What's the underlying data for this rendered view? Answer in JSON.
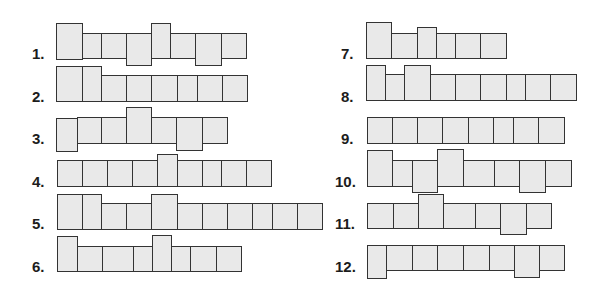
{
  "colors": {
    "fill": "#e9e9e9",
    "stroke": "#333333",
    "label": "#1c1c1c"
  },
  "rows": [
    {
      "label": "1.",
      "lx": 32,
      "ly": 46,
      "cells": [
        [
          56,
          82,
          23,
          59
        ],
        [
          82,
          101,
          33,
          58
        ],
        [
          101,
          126,
          33,
          58
        ],
        [
          126,
          151,
          33,
          65
        ],
        [
          151,
          170,
          23,
          58
        ],
        [
          170,
          195,
          33,
          58
        ],
        [
          195,
          221,
          33,
          65
        ],
        [
          221,
          246,
          33,
          58
        ]
      ]
    },
    {
      "label": "2.",
      "lx": 32,
      "ly": 89,
      "cells": [
        [
          56,
          82,
          66,
          101
        ],
        [
          82,
          101,
          66,
          101
        ],
        [
          101,
          126,
          75,
          101
        ],
        [
          126,
          151,
          75,
          101
        ],
        [
          151,
          177,
          75,
          101
        ],
        [
          177,
          197,
          75,
          101
        ],
        [
          197,
          222,
          75,
          101
        ],
        [
          222,
          247,
          75,
          101
        ]
      ]
    },
    {
      "label": "3.",
      "lx": 32,
      "ly": 131,
      "cells": [
        [
          56,
          77,
          118,
          151
        ],
        [
          77,
          101,
          117,
          143
        ],
        [
          101,
          126,
          117,
          143
        ],
        [
          126,
          151,
          107,
          143
        ],
        [
          151,
          176,
          117,
          143
        ],
        [
          176,
          202,
          117,
          150
        ],
        [
          202,
          227,
          117,
          143
        ]
      ]
    },
    {
      "label": "4.",
      "lx": 32,
      "ly": 174,
      "cells": [
        [
          57,
          82,
          160,
          186
        ],
        [
          82,
          107,
          160,
          186
        ],
        [
          107,
          132,
          160,
          186
        ],
        [
          132,
          157,
          160,
          186
        ],
        [
          157,
          177,
          154,
          186
        ],
        [
          177,
          202,
          160,
          186
        ],
        [
          202,
          221,
          160,
          186
        ],
        [
          221,
          246,
          160,
          186
        ],
        [
          246,
          271,
          160,
          186
        ]
      ]
    },
    {
      "label": "5.",
      "lx": 32,
      "ly": 216,
      "cells": [
        [
          57,
          82,
          194,
          229
        ],
        [
          82,
          101,
          194,
          229
        ],
        [
          101,
          126,
          203,
          229
        ],
        [
          126,
          151,
          203,
          229
        ],
        [
          151,
          177,
          194,
          229
        ],
        [
          177,
          202,
          203,
          229
        ],
        [
          202,
          227,
          203,
          229
        ],
        [
          227,
          252,
          203,
          229
        ],
        [
          252,
          272,
          203,
          229
        ],
        [
          272,
          297,
          203,
          229
        ],
        [
          297,
          322,
          203,
          229
        ]
      ]
    },
    {
      "label": "6.",
      "lx": 32,
      "ly": 259,
      "cells": [
        [
          57,
          77,
          236,
          271
        ],
        [
          77,
          102,
          246,
          271
        ],
        [
          102,
          133,
          246,
          271
        ],
        [
          133,
          152,
          246,
          271
        ],
        [
          152,
          171,
          235,
          271
        ],
        [
          171,
          190,
          246,
          271
        ],
        [
          190,
          216,
          246,
          271
        ],
        [
          216,
          241,
          246,
          271
        ]
      ]
    },
    {
      "label": "7.",
      "lx": 341,
      "ly": 46,
      "cells": [
        [
          366,
          391,
          22,
          58
        ],
        [
          391,
          417,
          33,
          58
        ],
        [
          417,
          436,
          27,
          58
        ],
        [
          436,
          455,
          33,
          58
        ],
        [
          455,
          480,
          33,
          58
        ],
        [
          480,
          506,
          33,
          58
        ]
      ]
    },
    {
      "label": "8.",
      "lx": 341,
      "ly": 89,
      "cells": [
        [
          366,
          385,
          65,
          100
        ],
        [
          385,
          404,
          74,
          100
        ],
        [
          404,
          430,
          65,
          100
        ],
        [
          430,
          455,
          74,
          100
        ],
        [
          455,
          480,
          74,
          100
        ],
        [
          480,
          506,
          74,
          100
        ],
        [
          506,
          525,
          74,
          100
        ],
        [
          525,
          550,
          74,
          100
        ],
        [
          550,
          576,
          74,
          100
        ]
      ]
    },
    {
      "label": "9.",
      "lx": 341,
      "ly": 131,
      "cells": [
        [
          367,
          392,
          117,
          143
        ],
        [
          392,
          417,
          117,
          143
        ],
        [
          417,
          442,
          117,
          143
        ],
        [
          442,
          468,
          117,
          143
        ],
        [
          468,
          493,
          117,
          143
        ],
        [
          493,
          513,
          117,
          143
        ],
        [
          513,
          538,
          117,
          143
        ],
        [
          538,
          564,
          117,
          143
        ]
      ]
    },
    {
      "label": "10.",
      "lx": 335,
      "ly": 174,
      "cells": [
        [
          367,
          392,
          150,
          186
        ],
        [
          392,
          412,
          160,
          186
        ],
        [
          412,
          437,
          160,
          192
        ],
        [
          437,
          463,
          149,
          186
        ],
        [
          463,
          494,
          160,
          186
        ],
        [
          494,
          519,
          160,
          186
        ],
        [
          519,
          545,
          160,
          192
        ],
        [
          545,
          571,
          160,
          186
        ]
      ]
    },
    {
      "label": "11.",
      "lx": 335,
      "ly": 216,
      "cells": [
        [
          367,
          393,
          203,
          228
        ],
        [
          393,
          418,
          203,
          228
        ],
        [
          418,
          443,
          194,
          228
        ],
        [
          443,
          475,
          203,
          228
        ],
        [
          475,
          500,
          203,
          228
        ],
        [
          500,
          526,
          203,
          234
        ],
        [
          526,
          551,
          203,
          228
        ]
      ]
    },
    {
      "label": "12.",
      "lx": 335,
      "ly": 259,
      "cells": [
        [
          367,
          386,
          245,
          278
        ],
        [
          386,
          412,
          245,
          270
        ],
        [
          412,
          437,
          245,
          270
        ],
        [
          437,
          463,
          245,
          270
        ],
        [
          463,
          489,
          245,
          270
        ],
        [
          489,
          514,
          245,
          270
        ],
        [
          514,
          539,
          245,
          277
        ],
        [
          539,
          564,
          245,
          270
        ]
      ]
    }
  ]
}
